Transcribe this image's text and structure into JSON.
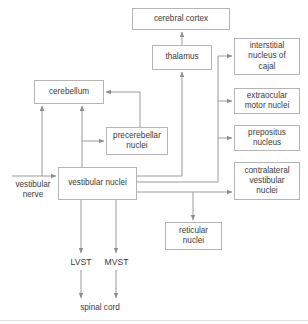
{
  "diagram": {
    "colors": {
      "box_border": "#b4b4b4",
      "text": "#3a3a3a",
      "edge": "#9a9a9a",
      "background": "#ffffff",
      "footer_rule": "#e2e2e2"
    },
    "nodes": [
      {
        "id": "cerebral_cortex",
        "label": "cerebral cortex",
        "x": 132,
        "y": 8,
        "w": 98,
        "h": 22
      },
      {
        "id": "thalamus",
        "label": "thalamus",
        "x": 152,
        "y": 45,
        "w": 60,
        "h": 25
      },
      {
        "id": "interstitial_nucleus_of_cajal",
        "label": "interstitial\nnucleus of\ncajal",
        "x": 234,
        "y": 38,
        "w": 66,
        "h": 37
      },
      {
        "id": "extraocular_motor_nuclei",
        "label": "extraocular\nmotor nuclei",
        "x": 234,
        "y": 88,
        "w": 66,
        "h": 26
      },
      {
        "id": "prepositus_nucleus",
        "label": "prepositus\nnucleus",
        "x": 234,
        "y": 125,
        "w": 66,
        "h": 26
      },
      {
        "id": "contralateral_vestibular_nuclei",
        "label": "contralateral\nvestibular\nnuclei",
        "x": 234,
        "y": 162,
        "w": 66,
        "h": 38
      },
      {
        "id": "cerebellum",
        "label": "cerebellum",
        "x": 34,
        "y": 80,
        "w": 70,
        "h": 24
      },
      {
        "id": "precerebellar_nuclei",
        "label": "precerebellar\nnuclei",
        "x": 106,
        "y": 127,
        "w": 62,
        "h": 28
      },
      {
        "id": "vestibular_nuclei",
        "label": "vestibular nuclei",
        "x": 58,
        "y": 167,
        "w": 79,
        "h": 33
      },
      {
        "id": "reticular_nuclei",
        "label": "reticular\nnuclei",
        "x": 165,
        "y": 222,
        "w": 57,
        "h": 28
      }
    ],
    "free_labels": [
      {
        "id": "vestibular_nerve",
        "label": "vestibular\nnerve",
        "x": 7,
        "y": 180,
        "w": 52
      },
      {
        "id": "spinal_cord",
        "label": "spinal cord",
        "x": 69,
        "y": 303,
        "w": 62
      }
    ],
    "tract_labels": [
      {
        "id": "lvst",
        "label": "LVST",
        "x": 66,
        "y": 257,
        "w": 30
      },
      {
        "id": "mvst",
        "label": "MVST",
        "x": 100,
        "y": 257,
        "w": 33
      }
    ],
    "edges": [
      {
        "id": "thalamus-to-cerebral-cortex",
        "from": "thalamus",
        "to": "cerebral cortex"
      },
      {
        "id": "vestibular-nuclei-to-thalamus",
        "from": "vestibular nuclei",
        "to": "thalamus"
      },
      {
        "id": "vestibular-nuclei-to-interstitial-nucleus-of-cajal",
        "from": "vestibular nuclei",
        "to": "interstitial nucleus of cajal"
      },
      {
        "id": "vestibular-nuclei-to-extraocular-motor-nuclei",
        "from": "vestibular nuclei",
        "to": "extraocular motor nuclei"
      },
      {
        "id": "vestibular-nuclei-to-prepositus-nucleus",
        "from": "vestibular nuclei",
        "to": "prepositus nucleus"
      },
      {
        "id": "vestibular-nuclei-to-contralateral-vestibular-nuclei",
        "from": "vestibular nuclei",
        "to": "contralateral vestibular nuclei"
      },
      {
        "id": "vestibular-nuclei-to-reticular-nuclei",
        "from": "vestibular nuclei",
        "to": "reticular nuclei"
      },
      {
        "id": "vestibular-nuclei-to-cerebellum",
        "from": "vestibular nuclei",
        "to": "cerebellum"
      },
      {
        "id": "vestibular-nuclei-to-precerebellar-nuclei",
        "from": "vestibular nuclei",
        "to": "precerebellar nuclei"
      },
      {
        "id": "precerebellar-nuclei-to-cerebellum",
        "from": "precerebellar nuclei",
        "to": "cerebellum"
      },
      {
        "id": "vestibular-nerve-to-vestibular-nuclei",
        "from": "vestibular nerve",
        "to": "vestibular nuclei"
      },
      {
        "id": "vestibular-nerve-to-cerebellum",
        "from": "vestibular nerve",
        "to": "cerebellum"
      },
      {
        "id": "lvst-to-spinal-cord",
        "from": "vestibular nuclei",
        "to": "spinal cord",
        "label": "LVST"
      },
      {
        "id": "mvst-to-spinal-cord",
        "from": "vestibular nuclei",
        "to": "spinal cord",
        "label": "MVST"
      }
    ]
  }
}
